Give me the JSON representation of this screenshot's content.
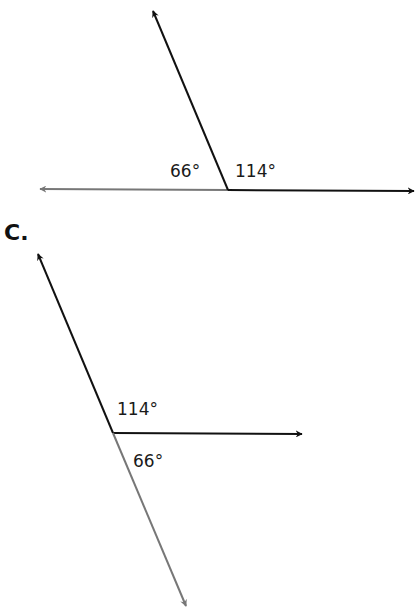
{
  "figures": [
    {
      "id": "top",
      "part_label": "",
      "angles": [
        {
          "label": "66°",
          "value": 66
        },
        {
          "label": "114°",
          "value": 114
        }
      ],
      "ray_colors": {
        "primary": "#111111",
        "secondary": "#777777"
      }
    },
    {
      "id": "c",
      "part_label": "C.",
      "angles": [
        {
          "label": "114°",
          "value": 114
        },
        {
          "label": "66°",
          "value": 66
        }
      ],
      "ray_colors": {
        "primary": "#111111",
        "secondary": "#777777"
      }
    }
  ]
}
